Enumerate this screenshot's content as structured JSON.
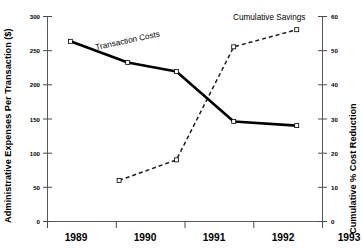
{
  "chart_data": {
    "type": "line",
    "title": "",
    "xlabel": "",
    "ylabel": "Administrative Expenses Per Transaction ($)",
    "y2label": "Cumulative % Cost Reduction",
    "x": [
      "1989",
      "1990",
      "1991",
      "1992",
      "1993"
    ],
    "xlim": [
      1988.6,
      1993.4
    ],
    "ylim": [
      0,
      300
    ],
    "y2lim": [
      0,
      60
    ],
    "yticks": [
      0,
      50,
      100,
      150,
      200,
      250,
      300
    ],
    "y2ticks": [
      0,
      10,
      20,
      30,
      40,
      50,
      60
    ],
    "grid": false,
    "legend": "inline-annotations",
    "series": [
      {
        "name": "Transaction Costs",
        "axis": "left",
        "style": "solid",
        "marker": "open-square",
        "x": [
          1989.0,
          1990.0,
          1990.85,
          1991.85,
          1992.95
        ],
        "values": [
          263,
          232,
          219,
          146,
          140
        ]
      },
      {
        "name": "Cumulative Savings",
        "axis": "right",
        "style": "dashed",
        "marker": "open-square",
        "x": [
          1989.85,
          1990.85,
          1991.85,
          1992.95
        ],
        "values": [
          12,
          18,
          51,
          56
        ]
      }
    ],
    "annotations": [
      {
        "text": "Transaction Costs",
        "x": 1990.2,
        "y": 248,
        "rotation": -12
      },
      {
        "text": "Cumulative Savings",
        "x": 1992.2,
        "y": 296,
        "rotation": 0
      }
    ]
  },
  "axes": {
    "y_left": {
      "title": "Administrative Expenses Per Transaction ($)",
      "tick_labels": [
        "300",
        "250",
        "200",
        "150",
        "100",
        "50",
        "0"
      ]
    },
    "y_right": {
      "title": "Cumulative % Cost Reduction",
      "tick_labels": [
        "60",
        "50",
        "40",
        "30",
        "20",
        "10",
        "0"
      ]
    },
    "x": {
      "tick_labels": [
        "1989",
        "1990",
        "1991",
        "1992",
        "1993"
      ]
    }
  },
  "labels": {
    "transaction_costs": "Transaction Costs",
    "cumulative_savings": "Cumulative Savings"
  },
  "colors": {
    "solid_line": "#000000",
    "dashed_line": "#1a1a1a",
    "axis": "#5a5a5a",
    "text": "#000000",
    "background": "#ffffff"
  }
}
